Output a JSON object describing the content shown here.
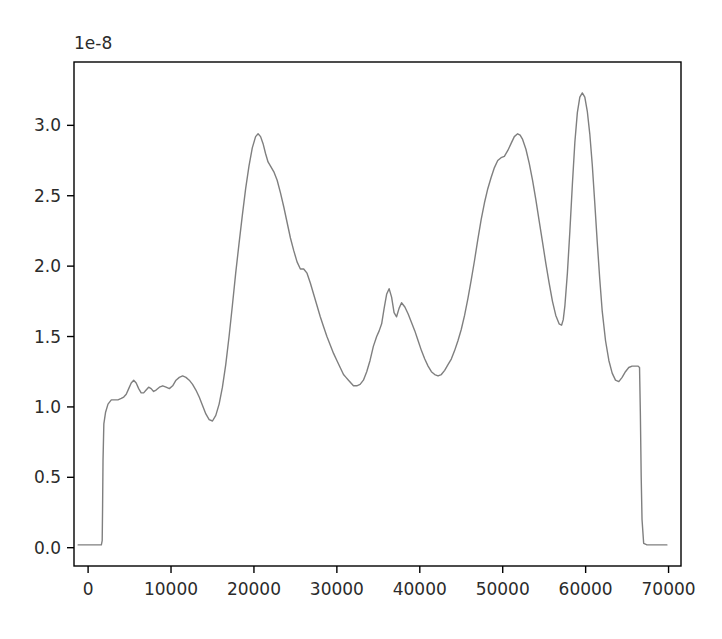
{
  "chart_data": {
    "type": "line",
    "title": "",
    "xlabel": "",
    "ylabel": "",
    "offset_text": "1e-8",
    "y_scale_factor": 1e-08,
    "grid": false,
    "legend": "none",
    "line_color": "#7f7f7f",
    "line_width": 1.4,
    "xlim": [
      -1700,
      71500
    ],
    "ylim": [
      -0.13,
      3.45
    ],
    "xticks": [
      0,
      10000,
      20000,
      30000,
      40000,
      50000,
      60000,
      70000
    ],
    "xtick_labels": [
      "0",
      "10000",
      "20000",
      "30000",
      "40000",
      "50000",
      "60000",
      "70000"
    ],
    "yticks": [
      0.0,
      0.5,
      1.0,
      1.5,
      2.0,
      2.5,
      3.0
    ],
    "ytick_labels": [
      "0.0",
      "0.5",
      "1.0",
      "1.5",
      "2.0",
      "2.5",
      "3.0"
    ],
    "x": [
      -1200,
      -600,
      0,
      400,
      900,
      1300,
      1600,
      1700,
      1750,
      1800,
      1900,
      2100,
      2400,
      2800,
      3200,
      3600,
      4000,
      4300,
      4600,
      4900,
      5200,
      5500,
      5800,
      6100,
      6400,
      6700,
      7000,
      7300,
      7600,
      7900,
      8200,
      8600,
      9000,
      9400,
      9800,
      10200,
      10600,
      11000,
      11400,
      11800,
      12200,
      12600,
      13000,
      13400,
      13800,
      14200,
      14600,
      15000,
      15400,
      15800,
      16200,
      16600,
      17000,
      17400,
      17800,
      18200,
      18600,
      19000,
      19400,
      19800,
      20200,
      20500,
      20800,
      21100,
      21400,
      21700,
      22000,
      22400,
      22800,
      23200,
      23600,
      24000,
      24400,
      24800,
      25200,
      25600,
      26000,
      26400,
      26800,
      27200,
      27600,
      28000,
      28400,
      28800,
      29200,
      29600,
      30000,
      30400,
      30800,
      31100,
      31400,
      31700,
      32000,
      32400,
      32800,
      33200,
      33600,
      34000,
      34400,
      34800,
      35100,
      35400,
      35700,
      36000,
      36300,
      36600,
      36900,
      37200,
      37500,
      37800,
      38200,
      38600,
      39000,
      39400,
      39800,
      40200,
      40600,
      41000,
      41400,
      41800,
      42200,
      42600,
      43000,
      43400,
      43800,
      44200,
      44600,
      45000,
      45400,
      45800,
      46200,
      46600,
      47000,
      47400,
      47800,
      48200,
      48600,
      49000,
      49400,
      49800,
      50200,
      50600,
      51000,
      51400,
      51800,
      52100,
      52400,
      52800,
      53200,
      53600,
      54000,
      54400,
      54800,
      55200,
      55600,
      56000,
      56400,
      56800,
      57100,
      57300,
      57500,
      57800,
      58100,
      58400,
      58700,
      59000,
      59300,
      59600,
      59900,
      60200,
      60500,
      60800,
      61100,
      61400,
      61700,
      62000,
      62400,
      62800,
      63200,
      63600,
      64000,
      64400,
      64800,
      65200,
      65600,
      66000,
      66300,
      66500,
      66600,
      66700,
      66800,
      67000,
      67400,
      68000,
      68600,
      69200,
      69800
    ],
    "y": [
      0.02,
      0.02,
      0.02,
      0.02,
      0.02,
      0.02,
      0.02,
      0.05,
      0.3,
      0.62,
      0.88,
      0.96,
      1.02,
      1.05,
      1.05,
      1.05,
      1.06,
      1.07,
      1.09,
      1.13,
      1.17,
      1.19,
      1.17,
      1.13,
      1.1,
      1.1,
      1.12,
      1.14,
      1.13,
      1.11,
      1.12,
      1.14,
      1.15,
      1.14,
      1.13,
      1.15,
      1.19,
      1.21,
      1.22,
      1.21,
      1.19,
      1.16,
      1.12,
      1.07,
      1.01,
      0.95,
      0.91,
      0.9,
      0.94,
      1.02,
      1.14,
      1.3,
      1.5,
      1.72,
      1.95,
      2.16,
      2.36,
      2.55,
      2.71,
      2.84,
      2.92,
      2.94,
      2.92,
      2.87,
      2.8,
      2.74,
      2.71,
      2.67,
      2.61,
      2.52,
      2.42,
      2.31,
      2.2,
      2.11,
      2.03,
      1.98,
      1.98,
      1.95,
      1.88,
      1.8,
      1.72,
      1.64,
      1.57,
      1.5,
      1.44,
      1.38,
      1.33,
      1.28,
      1.23,
      1.21,
      1.19,
      1.17,
      1.15,
      1.15,
      1.16,
      1.19,
      1.25,
      1.33,
      1.43,
      1.5,
      1.54,
      1.59,
      1.7,
      1.8,
      1.84,
      1.78,
      1.67,
      1.64,
      1.7,
      1.74,
      1.71,
      1.66,
      1.6,
      1.54,
      1.47,
      1.4,
      1.34,
      1.29,
      1.25,
      1.23,
      1.22,
      1.23,
      1.26,
      1.3,
      1.34,
      1.4,
      1.47,
      1.55,
      1.65,
      1.77,
      1.9,
      2.04,
      2.19,
      2.33,
      2.45,
      2.55,
      2.63,
      2.7,
      2.75,
      2.77,
      2.78,
      2.82,
      2.87,
      2.92,
      2.94,
      2.93,
      2.9,
      2.83,
      2.73,
      2.61,
      2.47,
      2.32,
      2.17,
      2.02,
      1.88,
      1.75,
      1.65,
      1.59,
      1.58,
      1.62,
      1.72,
      1.95,
      2.25,
      2.58,
      2.88,
      3.09,
      3.2,
      3.23,
      3.2,
      3.1,
      2.94,
      2.72,
      2.45,
      2.17,
      1.91,
      1.68,
      1.47,
      1.33,
      1.24,
      1.19,
      1.18,
      1.21,
      1.25,
      1.28,
      1.29,
      1.29,
      1.29,
      1.28,
      0.95,
      0.5,
      0.2,
      0.03,
      0.02,
      0.02,
      0.02,
      0.02,
      0.02
    ],
    "annotations": [
      {
        "label": "first major peak",
        "x": 20500,
        "y": 2.94
      },
      {
        "label": "second major peak",
        "x": 51800,
        "y": 2.94
      },
      {
        "label": "tallest peak",
        "x": 59600,
        "y": 3.23
      },
      {
        "label": "inter-peak trough",
        "x": 57300,
        "y": 1.58
      },
      {
        "label": "baseline plateau",
        "x": 8000,
        "y": 1.12
      }
    ]
  },
  "axes": {
    "spine_color": "#000000",
    "tick_color": "#000000",
    "background": "#ffffff"
  }
}
